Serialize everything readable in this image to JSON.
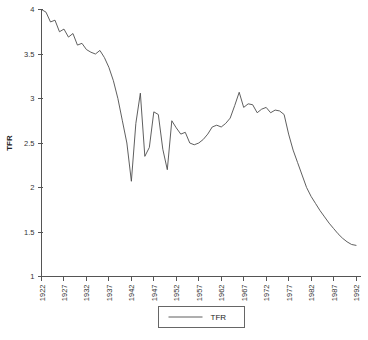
{
  "chart_data": {
    "type": "line",
    "title": "",
    "xlabel": "",
    "ylabel": "TFR",
    "xlim": [
      1922,
      1993
    ],
    "ylim": [
      1,
      4
    ],
    "grid": false,
    "legend_position": "bottom-center",
    "y_ticks": [
      1,
      1.5,
      2,
      2.5,
      3,
      3.5,
      4
    ],
    "y_tick_labels": [
      "1",
      "1.5",
      "2",
      "2.5",
      "3",
      "3.5",
      "4"
    ],
    "x_ticks": [
      1922,
      1927,
      1932,
      1937,
      1942,
      1947,
      1952,
      1957,
      1962,
      1967,
      1972,
      1977,
      1982,
      1987,
      1992
    ],
    "x_tick_labels": [
      "1922",
      "1927",
      "1932",
      "1937",
      "1942",
      "1947",
      "1952",
      "1957",
      "1962",
      "1967",
      "1972",
      "1977",
      "1982",
      "1987",
      "1992"
    ],
    "series": [
      {
        "name": "TFR",
        "color": "#4d4d4d",
        "x": [
          1922,
          1923,
          1924,
          1925,
          1926,
          1927,
          1928,
          1929,
          1930,
          1931,
          1932,
          1933,
          1934,
          1935,
          1936,
          1937,
          1938,
          1939,
          1940,
          1941,
          1942,
          1943,
          1944,
          1945,
          1946,
          1947,
          1948,
          1949,
          1950,
          1951,
          1952,
          1953,
          1954,
          1955,
          1956,
          1957,
          1958,
          1959,
          1960,
          1961,
          1962,
          1963,
          1964,
          1965,
          1966,
          1967,
          1968,
          1969,
          1970,
          1971,
          1972,
          1973,
          1974,
          1975,
          1976,
          1977,
          1978,
          1979,
          1980,
          1981,
          1982,
          1983,
          1984,
          1985,
          1986,
          1987,
          1988,
          1989,
          1990,
          1991,
          1992
        ],
        "values": [
          4.0,
          3.97,
          3.86,
          3.88,
          3.75,
          3.78,
          3.69,
          3.73,
          3.6,
          3.62,
          3.55,
          3.52,
          3.5,
          3.54,
          3.46,
          3.35,
          3.2,
          3.0,
          2.75,
          2.5,
          2.07,
          2.72,
          3.06,
          2.35,
          2.45,
          2.85,
          2.82,
          2.43,
          2.2,
          2.75,
          2.67,
          2.6,
          2.62,
          2.5,
          2.48,
          2.5,
          2.54,
          2.6,
          2.68,
          2.7,
          2.68,
          2.72,
          2.78,
          2.92,
          3.07,
          2.9,
          2.94,
          2.93,
          2.84,
          2.88,
          2.9,
          2.84,
          2.87,
          2.86,
          2.82,
          2.6,
          2.42,
          2.28,
          2.14,
          2.0,
          1.9,
          1.82,
          1.74,
          1.67,
          1.6,
          1.54,
          1.48,
          1.43,
          1.39,
          1.36,
          1.35
        ]
      }
    ],
    "legend": [
      {
        "label": "TFR",
        "color": "#4d4d4d"
      }
    ]
  },
  "axis": {
    "y_label": "TFR"
  }
}
